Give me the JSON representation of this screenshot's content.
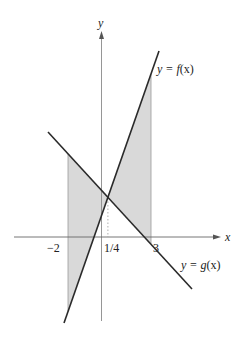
{
  "figure": {
    "axes": {
      "x_label": "x",
      "y_label": "y",
      "tick_labels": [
        {
          "text": "−2",
          "value": -2
        },
        {
          "text": "1/4",
          "value": 0.25
        },
        {
          "text": "3",
          "value": 3
        }
      ]
    },
    "curves": [
      {
        "name": "f",
        "label_prefix": "y = ",
        "label_func": "f",
        "label_arg": "(x)",
        "description": "increasing line"
      },
      {
        "name": "g",
        "label_prefix": "y = ",
        "label_func": "g",
        "label_arg": "(x)",
        "description": "decreasing line"
      }
    ],
    "shaded_region": {
      "description": "Region between y = f(x) and y = g(x) from x = -2 to x = 3, split at intersection x = 1/4",
      "from_x": -2,
      "to_x": 3,
      "intersection_x": "1/4",
      "fill_color": "#d9d9d9"
    },
    "colors": {
      "line": "#2a2a2a",
      "axis": "#555555",
      "shade": "#d9d9d9"
    }
  }
}
